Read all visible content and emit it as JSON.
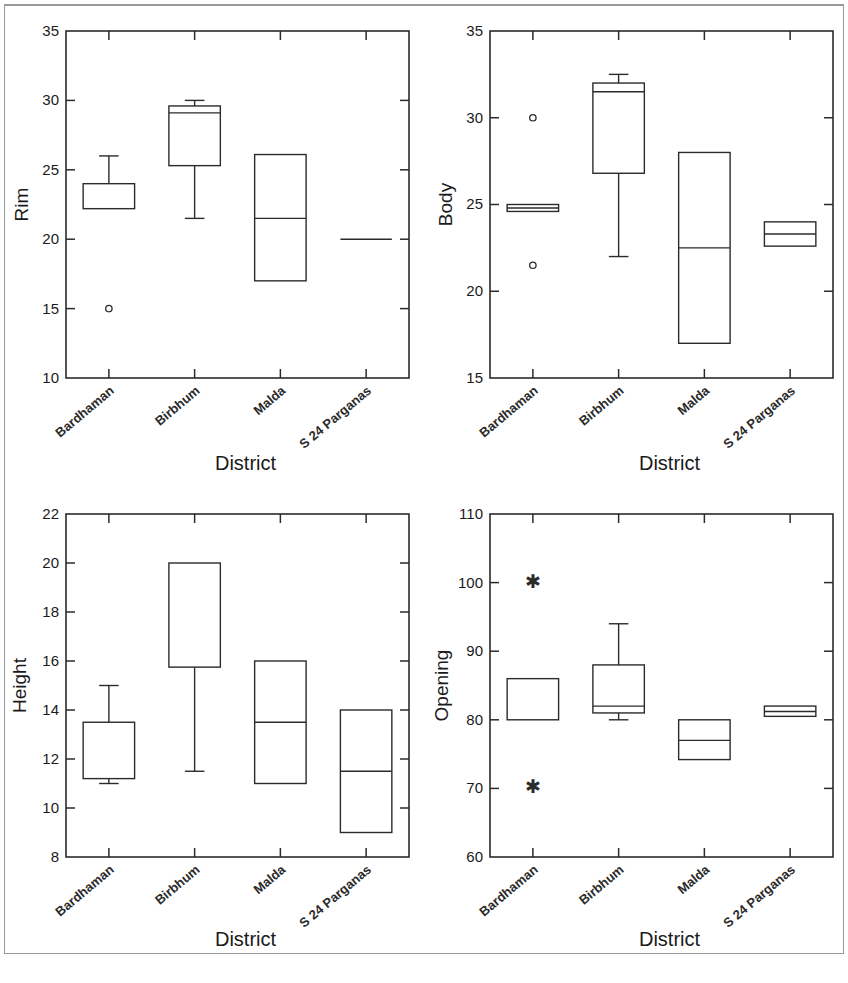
{
  "figure": {
    "title": "",
    "panel_count": 4,
    "border_color": "#9a9a9a",
    "line_color": "#2b2b2b",
    "background": "#ffffff"
  },
  "categories": [
    "Bardhaman",
    "Birbhum",
    "Malda",
    "S 24 Parganas"
  ],
  "xlabel": "District",
  "chart_data": [
    {
      "type": "box",
      "panel": "rim",
      "title": "",
      "xlabel": "District",
      "ylabel": "Rim",
      "ylim": [
        10,
        35
      ],
      "yticks": [
        10,
        15,
        20,
        25,
        30,
        35
      ],
      "grid": false,
      "categories": [
        "Bardhaman",
        "Birbhum",
        "Malda",
        "S 24 Parganas"
      ],
      "boxes": [
        {
          "category": "Bardhaman",
          "min": 22.2,
          "q1": 22.2,
          "median": 22.2,
          "q3": 24.0,
          "max": 26.0,
          "outliers": [
            15.0
          ],
          "outlier_symbol": "circle",
          "lower_whisker_cap": false,
          "upper_whisker_cap": true
        },
        {
          "category": "Birbhum",
          "min": 21.5,
          "q1": 25.3,
          "median": 29.1,
          "q3": 29.6,
          "max": 30.0,
          "outliers": [],
          "outlier_symbol": "circle",
          "lower_whisker_cap": true,
          "upper_whisker_cap": true
        },
        {
          "category": "Malda",
          "min": 17.0,
          "q1": 17.0,
          "median": 21.5,
          "q3": 26.1,
          "max": 26.1,
          "outliers": [],
          "outlier_symbol": "circle",
          "lower_whisker_cap": false,
          "upper_whisker_cap": false
        },
        {
          "category": "S 24 Parganas",
          "min": 20.0,
          "q1": 20.0,
          "median": 20.0,
          "q3": 20.0,
          "max": 20.0,
          "outliers": [],
          "outlier_symbol": "circle",
          "lower_whisker_cap": false,
          "upper_whisker_cap": false
        }
      ]
    },
    {
      "type": "box",
      "panel": "body",
      "title": "",
      "xlabel": "District",
      "ylabel": "Body",
      "ylim": [
        15,
        35
      ],
      "yticks": [
        15,
        20,
        25,
        30,
        35
      ],
      "grid": false,
      "categories": [
        "Bardhaman",
        "Birbhum",
        "Malda",
        "S 24 Parganas"
      ],
      "boxes": [
        {
          "category": "Bardhaman",
          "min": 24.6,
          "q1": 24.6,
          "median": 24.8,
          "q3": 25.0,
          "max": 25.0,
          "outliers": [
            30.0,
            21.5
          ],
          "outlier_symbol": "circle",
          "lower_whisker_cap": false,
          "upper_whisker_cap": false
        },
        {
          "category": "Birbhum",
          "min": 22.0,
          "q1": 26.8,
          "median": 31.5,
          "q3": 32.0,
          "max": 32.5,
          "outliers": [],
          "outlier_symbol": "circle",
          "lower_whisker_cap": true,
          "upper_whisker_cap": true
        },
        {
          "category": "Malda",
          "min": 17.0,
          "q1": 17.0,
          "median": 22.5,
          "q3": 28.0,
          "max": 28.0,
          "outliers": [],
          "outlier_symbol": "circle",
          "lower_whisker_cap": false,
          "upper_whisker_cap": false
        },
        {
          "category": "S 24 Parganas",
          "min": 22.6,
          "q1": 22.6,
          "median": 23.3,
          "q3": 24.0,
          "max": 24.0,
          "outliers": [],
          "outlier_symbol": "circle",
          "lower_whisker_cap": false,
          "upper_whisker_cap": false
        }
      ]
    },
    {
      "type": "box",
      "panel": "height",
      "title": "",
      "xlabel": "District",
      "ylabel": "Height",
      "ylim": [
        8,
        22
      ],
      "yticks": [
        8,
        10,
        12,
        14,
        16,
        18,
        20,
        22
      ],
      "grid": false,
      "categories": [
        "Bardhaman",
        "Birbhum",
        "Malda",
        "S 24 Parganas"
      ],
      "boxes": [
        {
          "category": "Bardhaman",
          "min": 11.0,
          "q1": 11.2,
          "median": 11.2,
          "q3": 13.5,
          "max": 15.0,
          "outliers": [],
          "outlier_symbol": "circle",
          "lower_whisker_cap": true,
          "upper_whisker_cap": true
        },
        {
          "category": "Birbhum",
          "min": 11.5,
          "q1": 15.75,
          "median": 20.0,
          "q3": 20.0,
          "max": 20.0,
          "outliers": [],
          "outlier_symbol": "circle",
          "lower_whisker_cap": true,
          "upper_whisker_cap": false
        },
        {
          "category": "Malda",
          "min": 11.0,
          "q1": 11.0,
          "median": 13.5,
          "q3": 16.0,
          "max": 16.0,
          "outliers": [],
          "outlier_symbol": "circle",
          "lower_whisker_cap": false,
          "upper_whisker_cap": false
        },
        {
          "category": "S 24 Parganas",
          "min": 9.0,
          "q1": 9.0,
          "median": 11.5,
          "q3": 14.0,
          "max": 14.0,
          "outliers": [],
          "outlier_symbol": "circle",
          "lower_whisker_cap": false,
          "upper_whisker_cap": false
        }
      ]
    },
    {
      "type": "box",
      "panel": "opening",
      "title": "",
      "xlabel": "District",
      "ylabel": "Opening",
      "ylim": [
        60,
        110
      ],
      "yticks": [
        60,
        70,
        80,
        90,
        100,
        110
      ],
      "grid": false,
      "categories": [
        "Bardhaman",
        "Birbhum",
        "Malda",
        "S 24 Parganas"
      ],
      "boxes": [
        {
          "category": "Bardhaman",
          "min": 80.0,
          "q1": 80.0,
          "median": 80.0,
          "q3": 86.0,
          "max": 86.0,
          "outliers": [
            100.0,
            70.0
          ],
          "outlier_symbol": "star",
          "lower_whisker_cap": false,
          "upper_whisker_cap": false
        },
        {
          "category": "Birbhum",
          "min": 80.0,
          "q1": 81.0,
          "median": 82.0,
          "q3": 88.0,
          "max": 94.0,
          "outliers": [],
          "outlier_symbol": "star",
          "lower_whisker_cap": true,
          "upper_whisker_cap": true
        },
        {
          "category": "Malda",
          "min": 74.2,
          "q1": 74.2,
          "median": 77.0,
          "q3": 80.0,
          "max": 80.0,
          "outliers": [],
          "outlier_symbol": "star",
          "lower_whisker_cap": false,
          "upper_whisker_cap": false
        },
        {
          "category": "S 24 Parganas",
          "min": 80.5,
          "q1": 80.5,
          "median": 81.2,
          "q3": 82.0,
          "max": 82.0,
          "outliers": [],
          "outlier_symbol": "star",
          "lower_whisker_cap": false,
          "upper_whisker_cap": false
        }
      ]
    }
  ]
}
